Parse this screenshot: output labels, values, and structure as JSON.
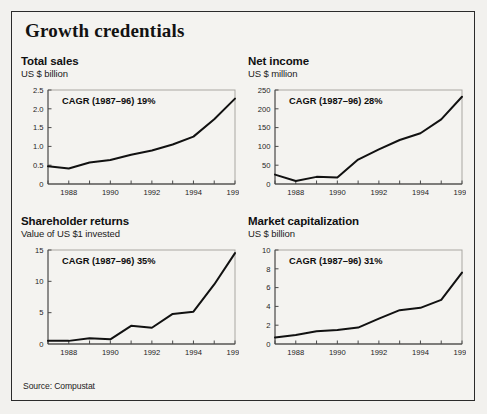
{
  "panel": {
    "title": "Growth credentials",
    "source": "Source: Compustat"
  },
  "charts": [
    {
      "title": "Total sales",
      "subtitle": "US $ billion",
      "annotation": "CAGR (1987–96) 19%"
    },
    {
      "title": "Net income",
      "subtitle": "US $ million",
      "annotation": "CAGR (1987–96) 28%"
    },
    {
      "title": "Shareholder returns",
      "subtitle": "Value of US $1 invested",
      "annotation": "CAGR (1987–96) 35%"
    },
    {
      "title": "Market capitalization",
      "subtitle": "US $ billion",
      "annotation": "CAGR (1987–96) 31%"
    }
  ],
  "chart_data": [
    {
      "type": "line",
      "title": "Total sales",
      "subtitle": "US $ billion",
      "annotation": "CAGR (1987–96) 19%",
      "xlabel": "",
      "ylabel": "US $ billion",
      "x": [
        1987,
        1988,
        1989,
        1990,
        1991,
        1992,
        1993,
        1994,
        1995,
        1996
      ],
      "values": [
        0.47,
        0.41,
        0.57,
        0.64,
        0.78,
        0.89,
        1.05,
        1.26,
        1.72,
        2.27
      ],
      "xlim": [
        1987,
        1996
      ],
      "ylim": [
        0,
        2.5
      ],
      "yticks": [
        0,
        0.5,
        1.0,
        1.5,
        2.0,
        2.5
      ],
      "ytick_labels": [
        "0",
        "0.5",
        "1.0",
        "1.5",
        "2.0",
        "2.5"
      ],
      "xticks": [
        1987,
        1988,
        1989,
        1990,
        1991,
        1992,
        1993,
        1994,
        1995,
        1996
      ],
      "xtick_labels": [
        "",
        "1988",
        "",
        "1990",
        "",
        "1992",
        "",
        "1994",
        "",
        "1996"
      ],
      "grid": false,
      "legend": "none",
      "line_color": "#111111"
    },
    {
      "type": "line",
      "title": "Net income",
      "subtitle": "US $ million",
      "annotation": "CAGR (1987–96) 28%",
      "xlabel": "",
      "ylabel": "US $ million",
      "x": [
        1987,
        1988,
        1989,
        1990,
        1991,
        1992,
        1993,
        1994,
        1995,
        1996
      ],
      "values": [
        25,
        8,
        19,
        17,
        65,
        92,
        117,
        135,
        172,
        232
      ],
      "xlim": [
        1987,
        1996
      ],
      "ylim": [
        0,
        250
      ],
      "yticks": [
        0,
        50,
        100,
        150,
        200,
        250
      ],
      "ytick_labels": [
        "0",
        "50",
        "100",
        "150",
        "200",
        "250"
      ],
      "xticks": [
        1987,
        1988,
        1989,
        1990,
        1991,
        1992,
        1993,
        1994,
        1995,
        1996
      ],
      "xtick_labels": [
        "",
        "1988",
        "",
        "1990",
        "",
        "1992",
        "",
        "1994",
        "",
        "1996"
      ],
      "grid": false,
      "legend": "none",
      "line_color": "#111111"
    },
    {
      "type": "line",
      "title": "Shareholder returns",
      "subtitle": "Value of US $1 invested",
      "annotation": "CAGR (1987–96) 35%",
      "xlabel": "",
      "ylabel": "Value of US $1 invested",
      "x": [
        1987,
        1988,
        1989,
        1990,
        1991,
        1992,
        1993,
        1994,
        1995,
        1996
      ],
      "values": [
        0.5,
        0.5,
        0.9,
        0.75,
        2.9,
        2.6,
        4.8,
        5.15,
        9.5,
        14.5
      ],
      "xlim": [
        1987,
        1996
      ],
      "ylim": [
        0,
        15
      ],
      "yticks": [
        0,
        5,
        10,
        15
      ],
      "ytick_labels": [
        "0",
        "5",
        "10",
        "15"
      ],
      "xticks": [
        1987,
        1988,
        1989,
        1990,
        1991,
        1992,
        1993,
        1994,
        1995,
        1996
      ],
      "xtick_labels": [
        "",
        "1988",
        "",
        "1990",
        "",
        "1992",
        "",
        "1994",
        "",
        "1996"
      ],
      "grid": false,
      "legend": "none",
      "line_color": "#111111"
    },
    {
      "type": "line",
      "title": "Market capitalization",
      "subtitle": "US $ billion",
      "annotation": "CAGR (1987–96) 31%",
      "xlabel": "",
      "ylabel": "US $ billion",
      "x": [
        1987,
        1988,
        1989,
        1990,
        1991,
        1992,
        1993,
        1994,
        1995,
        1996
      ],
      "values": [
        0.7,
        0.95,
        1.35,
        1.5,
        1.75,
        2.7,
        3.6,
        3.85,
        4.7,
        7.6
      ],
      "xlim": [
        1987,
        1996
      ],
      "ylim": [
        0,
        10
      ],
      "yticks": [
        0,
        2,
        4,
        6,
        8,
        10
      ],
      "ytick_labels": [
        "0",
        "2",
        "4",
        "6",
        "8",
        "10"
      ],
      "xticks": [
        1987,
        1988,
        1989,
        1990,
        1991,
        1992,
        1993,
        1994,
        1995,
        1996
      ],
      "xtick_labels": [
        "",
        "1988",
        "",
        "1990",
        "",
        "1992",
        "",
        "1994",
        "",
        "1996"
      ],
      "grid": false,
      "legend": "none",
      "line_color": "#111111"
    }
  ]
}
